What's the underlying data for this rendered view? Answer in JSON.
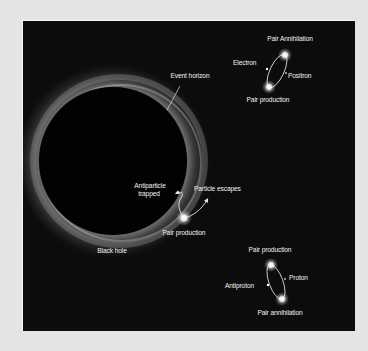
{
  "diagram": {
    "colors": {
      "page_background": "#e4e4e2",
      "panel_background": "#0c0c0c",
      "label_color": "#f2f2f2",
      "glow_color": "#bcbcbc"
    },
    "black_hole": {
      "label": "Black hole",
      "event_horizon_label": "Event horizon"
    },
    "escape_event": {
      "antiparticle_label_line1": "Antiparticle",
      "antiparticle_label_line2": "trapped",
      "particle_label": "Particle escapes",
      "production_label": "Pair production"
    },
    "electron_pair": {
      "top_label": "Pair Annihilation",
      "left_label": "Electron",
      "right_label": "Positron",
      "bottom_label": "Pair production"
    },
    "proton_pair": {
      "top_label": "Pair production",
      "right_label": "Proton",
      "left_label": "Antiproton",
      "bottom_label": "Pair annihilation"
    }
  }
}
